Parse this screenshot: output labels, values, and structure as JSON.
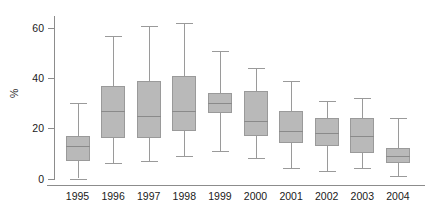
{
  "chart_data": {
    "type": "box",
    "title": "",
    "xlabel": "",
    "ylabel": "%",
    "ylim": [
      -2,
      68
    ],
    "yticks": [
      0,
      20,
      40,
      60
    ],
    "ytick_labels": [
      "0",
      "20",
      "40",
      "60"
    ],
    "grid": false,
    "legend": null,
    "categories": [
      "1995",
      "1996",
      "1997",
      "1998",
      "1999",
      "2000",
      "2001",
      "2002",
      "2003",
      "2004"
    ],
    "boxes": [
      {
        "category": "1995",
        "whisker_low": 0,
        "q1": 7,
        "median": 13,
        "q3": 17,
        "whisker_high": 30
      },
      {
        "category": "1996",
        "whisker_low": 6,
        "q1": 16,
        "median": 27,
        "q3": 37,
        "whisker_high": 57
      },
      {
        "category": "1997",
        "whisker_low": 7,
        "q1": 16,
        "median": 25,
        "q3": 39,
        "whisker_high": 61
      },
      {
        "category": "1998",
        "whisker_low": 9,
        "q1": 19,
        "median": 27,
        "q3": 41,
        "whisker_high": 62
      },
      {
        "category": "1999",
        "whisker_low": 11,
        "q1": 26,
        "median": 30,
        "q3": 34,
        "whisker_high": 51
      },
      {
        "category": "2000",
        "whisker_low": 8,
        "q1": 17,
        "median": 23,
        "q3": 35,
        "whisker_high": 44
      },
      {
        "category": "2001",
        "whisker_low": 4,
        "q1": 14,
        "median": 19,
        "q3": 27,
        "whisker_high": 39
      },
      {
        "category": "2002",
        "whisker_low": 3,
        "q1": 13,
        "median": 18,
        "q3": 24,
        "whisker_high": 31
      },
      {
        "category": "2003",
        "whisker_low": 4,
        "q1": 10,
        "median": 17,
        "q3": 24,
        "whisker_high": 32
      },
      {
        "category": "2004",
        "whisker_low": 1,
        "q1": 6,
        "median": 9,
        "q3": 12,
        "whisker_high": 24
      }
    ],
    "colors": {
      "box_fill": "#b9b9b9",
      "box_stroke": "#9a9a9a",
      "median": "#8a8a8a",
      "axis": "#8c8c8c",
      "text": "#1a1a1a",
      "background": "#ffffff"
    }
  }
}
